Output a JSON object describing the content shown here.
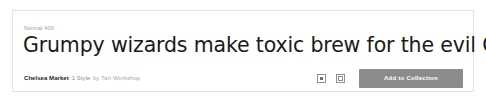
{
  "card": {
    "weight_label": "Normal 400",
    "specimen_text": "Grumpy wizards make toxic brew for the evil Queen",
    "meta": {
      "family_name": "Chelsea Market",
      "style_count": "1 Style",
      "foundry": "by Tart Workshop"
    },
    "actions": {
      "add_icon_name": "add-to-grid-icon",
      "duplicate_icon_name": "duplicate-square-icon",
      "primary_label": "Add to Collection"
    },
    "colors": {
      "card_border": "#e3e3e3",
      "specimen_text": "#1a1a1a",
      "muted_text": "#8c8c8c",
      "primary_button_bg": "#8c8c8c",
      "primary_button_text": "#ffffff"
    }
  }
}
